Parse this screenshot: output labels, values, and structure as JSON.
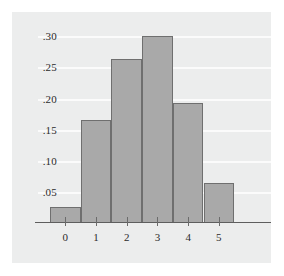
{
  "chart_data": {
    "type": "bar",
    "title": "",
    "subtitle": "",
    "xlabel": "",
    "ylabel": "",
    "categories": [
      "0",
      "1",
      "2",
      "3",
      "4",
      "5"
    ],
    "values": [
      0.025,
      0.165,
      0.263,
      0.3,
      0.193,
      0.065
    ],
    "series": [
      {
        "name": "Relative frequency",
        "values": [
          0.025,
          0.165,
          0.263,
          0.3,
          0.193,
          0.065
        ]
      }
    ],
    "ylim": [
      0.0,
      0.315
    ],
    "xlim": [
      -0.5,
      5.5
    ],
    "ytick_labels": [
      ".05",
      ".10",
      ".15",
      ".20",
      ".25",
      ".30"
    ],
    "ytick_values": [
      0.05,
      0.1,
      0.15,
      0.2,
      0.25,
      0.3
    ],
    "xtick_labels": [
      "0",
      "1",
      "2",
      "3",
      "4",
      "5"
    ],
    "grid": true,
    "grid_axis": "y",
    "legend": false,
    "legend_position": "none",
    "annotations": [],
    "colors": {
      "bar_fill": "#a9a9a9",
      "bar_edge": "#6f6f6f",
      "panel_background": "#eceded",
      "figure_background": "#ffffff",
      "gridline": "#fbfbfb",
      "axis_line": "#5e5e5e",
      "tick_text": "#2b2b2b"
    }
  }
}
